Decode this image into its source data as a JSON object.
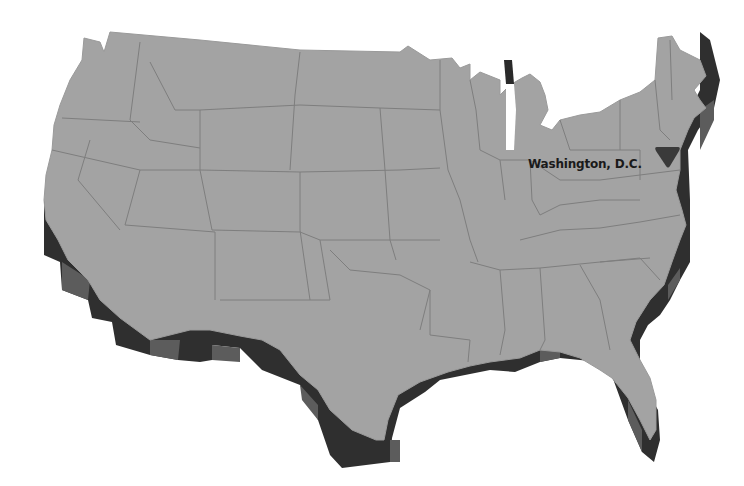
{
  "map": {
    "subject": "Contiguous United States (3D extruded relief)",
    "style": "grayscale",
    "colors": {
      "land_top": "#a3a3a3",
      "state_border": "#7e7e7e",
      "extrusion_light": "#5a5a5a",
      "extrusion_dark": "#2a2a2a",
      "background": "#ffffff",
      "marker": "#3a3a3a",
      "label_text": "#1a1a1a"
    },
    "markers": [
      {
        "label": "Washington, D.C.",
        "icon": "inverted-triangle",
        "x": 668,
        "y": 158
      }
    ]
  }
}
